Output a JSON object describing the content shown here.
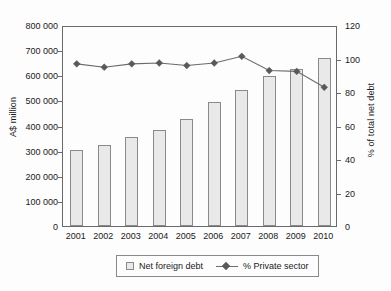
{
  "chart_data": {
    "type": "bar",
    "title": "",
    "subtitle": "",
    "xlabel": "",
    "ylabel": "A$ million",
    "ylabel_right": "% of total net debt",
    "categories": [
      "2001",
      "2002",
      "2003",
      "2004",
      "2005",
      "2006",
      "2007",
      "2008",
      "2009",
      "2010"
    ],
    "ylim": [
      0,
      800000
    ],
    "ylim_right": [
      0,
      120
    ],
    "yticks": [
      0,
      100000,
      200000,
      300000,
      400000,
      500000,
      600000,
      700000,
      800000
    ],
    "ytick_labels": [
      "0",
      "100 000",
      "200 000",
      "300 000",
      "400 000",
      "500 000",
      "600 000",
      "700 000",
      "800 000"
    ],
    "yticks_right": [
      0,
      20,
      40,
      60,
      80,
      100,
      120
    ],
    "ytick_labels_right": [
      "0",
      "20",
      "40",
      "60",
      "80",
      "100",
      "120"
    ],
    "grid": false,
    "legend_position": "below",
    "series": [
      {
        "name": "Net foreign debt",
        "type": "bar",
        "axis": "left",
        "unit": "A$ million",
        "fill_color": "#e9e9e9",
        "edge_color": "#8a8a8a",
        "values": [
          303000,
          322000,
          353000,
          383000,
          426000,
          494000,
          541000,
          598000,
          625000,
          669000
        ]
      },
      {
        "name": "% Private sector",
        "type": "line",
        "axis": "right",
        "unit": "% of total net debt",
        "line_color": "#6a6a6a",
        "marker": "diamond",
        "marker_color": "#595959",
        "values": [
          98.0,
          96.0,
          98.0,
          98.5,
          97.0,
          98.5,
          102.5,
          94.0,
          93.5,
          84.0
        ]
      }
    ]
  },
  "axes": {
    "left_title": "A$ million",
    "right_title": "% of total net debt"
  },
  "legend": {
    "items": [
      {
        "label": "Net foreign debt",
        "marker": "square-swatch"
      },
      {
        "label": "% Private sector",
        "marker": "line-diamond-swatch"
      }
    ]
  }
}
